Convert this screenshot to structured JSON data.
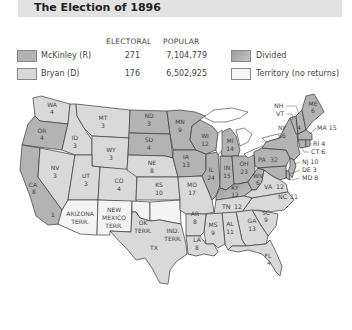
{
  "title": "The Election of 1896",
  "legend": {
    "headers": {
      "electoral": "ELECTORAL",
      "popular": "POPULAR"
    },
    "candidates": [
      {
        "name": "McKinley (R)",
        "electoral": "271",
        "popular": "7,104,779",
        "color": "#b3b3b3"
      },
      {
        "name": "Bryan (D)",
        "electoral": "176",
        "popular": "6,502,925",
        "color": "#d9d9d9"
      }
    ],
    "other": [
      {
        "name": "Divided",
        "color": "#a8a8a8"
      },
      {
        "name": "Territory (no returns)",
        "color": "#f4f4f4"
      }
    ]
  },
  "states": [
    {
      "abbr": "WA",
      "votes": "4",
      "winner": "Bryan"
    },
    {
      "abbr": "OR",
      "votes": "4",
      "winner": "McKinley"
    },
    {
      "abbr": "CA",
      "votes": "8",
      "winner": "McKinley",
      "split": "1"
    },
    {
      "abbr": "ID",
      "votes": "3",
      "winner": "Bryan"
    },
    {
      "abbr": "NV",
      "votes": "3",
      "winner": "Bryan"
    },
    {
      "abbr": "MT",
      "votes": "3",
      "winner": "Bryan"
    },
    {
      "abbr": "WY",
      "votes": "3",
      "winner": "Bryan"
    },
    {
      "abbr": "UT",
      "votes": "3",
      "winner": "Bryan"
    },
    {
      "abbr": "CO",
      "votes": "4",
      "winner": "Bryan"
    },
    {
      "abbr": "ND",
      "votes": "3",
      "winner": "McKinley"
    },
    {
      "abbr": "SD",
      "votes": "4",
      "winner": "Bryan"
    },
    {
      "abbr": "NE",
      "votes": "8",
      "winner": "Bryan"
    },
    {
      "abbr": "KS",
      "votes": "10",
      "winner": "Bryan"
    },
    {
      "abbr": "MN",
      "votes": "9",
      "winner": "McKinley"
    },
    {
      "abbr": "IA",
      "votes": "13",
      "winner": "McKinley"
    },
    {
      "abbr": "MO",
      "votes": "17",
      "winner": "Bryan"
    },
    {
      "abbr": "WI",
      "votes": "12",
      "winner": "McKinley"
    },
    {
      "abbr": "IL",
      "votes": "24",
      "winner": "McKinley"
    },
    {
      "abbr": "MI",
      "votes": "14",
      "winner": "McKinley"
    },
    {
      "abbr": "IN",
      "votes": "15",
      "winner": "McKinley"
    },
    {
      "abbr": "OH",
      "votes": "23",
      "winner": "McKinley"
    },
    {
      "abbr": "KY",
      "votes": "12",
      "winner": "Divided"
    },
    {
      "abbr": "WV",
      "votes": "6",
      "winner": "McKinley"
    },
    {
      "abbr": "VA",
      "votes": "12",
      "winner": "Bryan"
    },
    {
      "abbr": "PA",
      "votes": "32",
      "winner": "McKinley"
    },
    {
      "abbr": "NY",
      "votes": "36",
      "winner": "McKinley"
    },
    {
      "abbr": "VT",
      "votes": "4",
      "winner": "McKinley"
    },
    {
      "abbr": "NH",
      "votes": "4",
      "winner": "McKinley"
    },
    {
      "abbr": "ME",
      "votes": "6",
      "winner": "McKinley"
    },
    {
      "abbr": "MA",
      "votes": "15",
      "winner": "McKinley"
    },
    {
      "abbr": "RI",
      "votes": "4",
      "winner": "McKinley"
    },
    {
      "abbr": "CT",
      "votes": "6",
      "winner": "McKinley"
    },
    {
      "abbr": "NJ",
      "votes": "10",
      "winner": "McKinley"
    },
    {
      "abbr": "DE",
      "votes": "3",
      "winner": "McKinley"
    },
    {
      "abbr": "MD",
      "votes": "8",
      "winner": "McKinley"
    },
    {
      "abbr": "NC",
      "votes": "11",
      "winner": "Bryan"
    },
    {
      "abbr": "TN",
      "votes": "12",
      "winner": "Bryan"
    },
    {
      "abbr": "SC",
      "votes": "9",
      "winner": "Bryan"
    },
    {
      "abbr": "GA",
      "votes": "13",
      "winner": "Bryan"
    },
    {
      "abbr": "AL",
      "votes": "11",
      "winner": "Bryan"
    },
    {
      "abbr": "MS",
      "votes": "9",
      "winner": "Bryan"
    },
    {
      "abbr": "AR",
      "votes": "8",
      "winner": "Bryan"
    },
    {
      "abbr": "LA",
      "votes": "8",
      "winner": "Bryan"
    },
    {
      "abbr": "TX",
      "votes": "",
      "winner": "Bryan"
    },
    {
      "abbr": "FL",
      "votes": "4",
      "winner": "Bryan"
    }
  ],
  "territories": [
    {
      "line1": "ARIZONA",
      "line2": "TERR."
    },
    {
      "line1": "NEW",
      "line2": "MEXICO",
      "line3": "TERR."
    },
    {
      "line1": "OK",
      "line2": "TERR."
    },
    {
      "line1": "IND.",
      "line2": "TERR."
    }
  ]
}
